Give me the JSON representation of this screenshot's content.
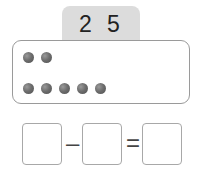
{
  "header": {
    "digits": [
      "2",
      "5"
    ]
  },
  "panel": {
    "rows": [
      {
        "dot_count": 2
      },
      {
        "dot_count": 5
      }
    ],
    "dot_color": "#666666"
  },
  "equation": {
    "boxes": [
      {
        "value": ""
      },
      {
        "value": ""
      },
      {
        "value": ""
      }
    ],
    "operators": [
      "–",
      "="
    ]
  }
}
